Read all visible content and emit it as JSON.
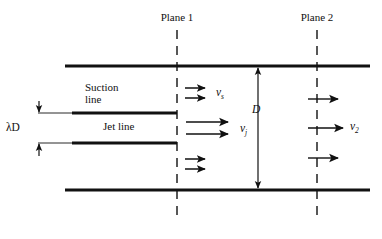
{
  "figure": {
    "type": "engineering-schematic",
    "background_color": "#ffffff",
    "ink_color": "#111111"
  },
  "labels": {
    "plane1": "Plane 1",
    "plane2": "Plane 2",
    "suction_line_1": "Suction",
    "suction_line_2": "line",
    "jet_line": "Jet line",
    "lambda_d": "λD",
    "lambda_symbol": "λ",
    "diameter_d": "D",
    "v_s_base": "v",
    "v_s_sub": "s",
    "v_j_base": "v",
    "v_j_sub": "j",
    "v_2_base": "v",
    "v_2_sub": "2"
  },
  "geometry": {
    "pipe_top_y": 66,
    "pipe_bottom_y": 190,
    "pipe_left_x": 65,
    "pipe_right_x": 370,
    "plane1_x": 177,
    "plane2_x": 317,
    "nozzle_top_y": 113,
    "nozzle_bottom_y": 143,
    "nozzle_thick_left_x": 72,
    "nozzle_thin_left_x": 38,
    "diameter_dim_x": 258,
    "lambda_dim_x": 39
  },
  "elements": {
    "walls": [
      "top-pipe-wall",
      "bottom-pipe-wall"
    ],
    "nozzle_plates": [
      "suction-side-nozzle-plate",
      "jet-side-nozzle-plate"
    ],
    "planes": [
      "plane-1-dashed-line",
      "plane-2-dashed-line"
    ],
    "dimensions": [
      "lambda-d-dimension",
      "d-dimension"
    ],
    "flow_arrows": {
      "suction_top": 2,
      "jet": 2,
      "suction_bottom": 2,
      "plane2": 3
    }
  }
}
